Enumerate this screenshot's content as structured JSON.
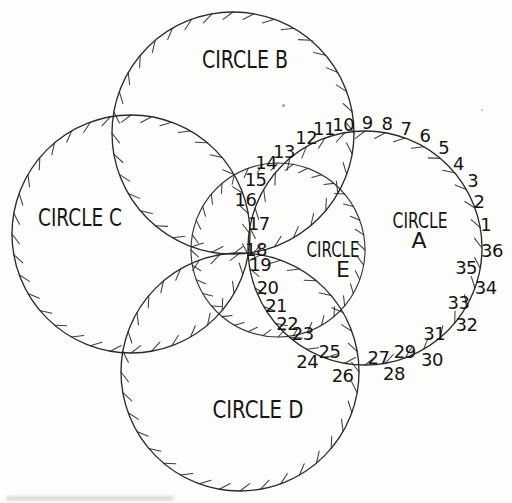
{
  "page": {
    "background": "#fdfdfb"
  },
  "diagram": {
    "ink": "#2b2b2b",
    "number_color": "#141414",
    "label_color": "#161616",
    "ticks": {
      "count": 36,
      "length": 7,
      "slant_deg": 5
    },
    "number_font_px": 18,
    "circles": [
      {
        "id": "B",
        "cx": 233,
        "cy": 133,
        "r": 121,
        "label_lines": [
          "CIRCLE B"
        ],
        "label_pos": [
          [
            245,
            68
          ]
        ],
        "label_len": [
          86
        ],
        "label_font": 25
      },
      {
        "id": "C",
        "cx": 131,
        "cy": 234,
        "r": 119,
        "label_lines": [
          "CIRCLE C"
        ],
        "label_pos": [
          [
            80,
            226
          ]
        ],
        "label_len": [
          84
        ],
        "label_font": 25
      },
      {
        "id": "D",
        "cx": 240,
        "cy": 372,
        "r": 119,
        "label_lines": [
          "CIRCLE D"
        ],
        "label_pos": [
          [
            258,
            418
          ]
        ],
        "label_len": [
          91
        ],
        "label_font": 25
      },
      {
        "id": "A",
        "cx": 365,
        "cy": 248,
        "r": 117,
        "label_lines": [
          "CIRCLE",
          "A"
        ],
        "label_pos": [
          [
            420,
            228
          ],
          [
            419,
            248
          ]
        ],
        "label_len": [
          55,
          14
        ],
        "label_font": 22
      },
      {
        "id": "E",
        "cx": 278,
        "cy": 250,
        "r": 87,
        "label_lines": [
          "CIRCLE",
          "E"
        ],
        "label_pos": [
          [
            333,
            257
          ],
          [
            343,
            277
          ]
        ],
        "label_len": [
          53,
          11
        ],
        "label_font": 22
      }
    ],
    "numbers": [
      {
        "n": "1",
        "a": 11,
        "dr": 6
      },
      {
        "n": "2",
        "a": 22,
        "dr": 6
      },
      {
        "n": "3",
        "a": 32,
        "dr": 10
      },
      {
        "n": "4",
        "a": 42,
        "dr": 9
      },
      {
        "n": "5",
        "a": 52,
        "dr": 11
      },
      {
        "n": "6",
        "a": 62,
        "dr": 11
      },
      {
        "n": "7",
        "a": 71,
        "dr": 9
      },
      {
        "n": "8",
        "a": 80,
        "dr": 9
      },
      {
        "n": "9",
        "a": 89,
        "dr": 9
      },
      {
        "n": "10",
        "a": 100,
        "dr": 8
      },
      {
        "n": "11",
        "a": 109,
        "dr": 9
      },
      {
        "n": "12",
        "a": 118,
        "dr": 8
      },
      {
        "n": "13",
        "a": 130,
        "dr": 9
      },
      {
        "n": "14",
        "a": 139,
        "dr": 14
      },
      {
        "n": "15",
        "a": 148,
        "dr": 12
      },
      {
        "n": "16",
        "a": 158,
        "dr": 12
      },
      {
        "n": "17",
        "a": 167,
        "dr": -8
      },
      {
        "n": "18",
        "a": 181,
        "dr": -8
      },
      {
        "n": "19",
        "a": 189,
        "dr": -11
      },
      {
        "n": "20",
        "a": 202,
        "dr": -12
      },
      {
        "n": "21",
        "a": 213,
        "dr": -11
      },
      {
        "n": "22",
        "a": 224,
        "dr": -9
      },
      {
        "n": "23",
        "a": 234,
        "dr": -11
      },
      {
        "n": "24",
        "a": 243,
        "dr": 10
      },
      {
        "n": "25",
        "a": 251,
        "dr": -8
      },
      {
        "n": "26",
        "a": 260,
        "dr": 12
      },
      {
        "n": "27",
        "a": 277,
        "dr": -7
      },
      {
        "n": "28",
        "a": 283,
        "dr": 12
      },
      {
        "n": "29",
        "a": 291,
        "dr": -6
      },
      {
        "n": "30",
        "a": 301,
        "dr": 13
      },
      {
        "n": "31",
        "a": 309,
        "dr": -7
      },
      {
        "n": "32",
        "a": 323,
        "dr": 10
      },
      {
        "n": "33",
        "a": 330,
        "dr": -9
      },
      {
        "n": "34",
        "a": 342,
        "dr": 10
      },
      {
        "n": "35",
        "a": 349,
        "dr": -14
      },
      {
        "n": "36",
        "a": 359,
        "dr": 10
      }
    ]
  }
}
